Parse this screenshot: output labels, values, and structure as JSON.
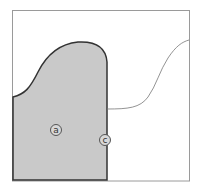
{
  "diagram": {
    "colors": {
      "frame": "#9a9a9a",
      "shaded_fill": "#c9c9c9",
      "shaded_outline": "#333333",
      "thin_curve": "#777777",
      "background": "#ffffff"
    },
    "labels": [
      {
        "id": "a",
        "text": "a",
        "x": 50,
        "y": 124
      },
      {
        "id": "c",
        "text": "c",
        "x": 99,
        "y": 134
      }
    ]
  }
}
